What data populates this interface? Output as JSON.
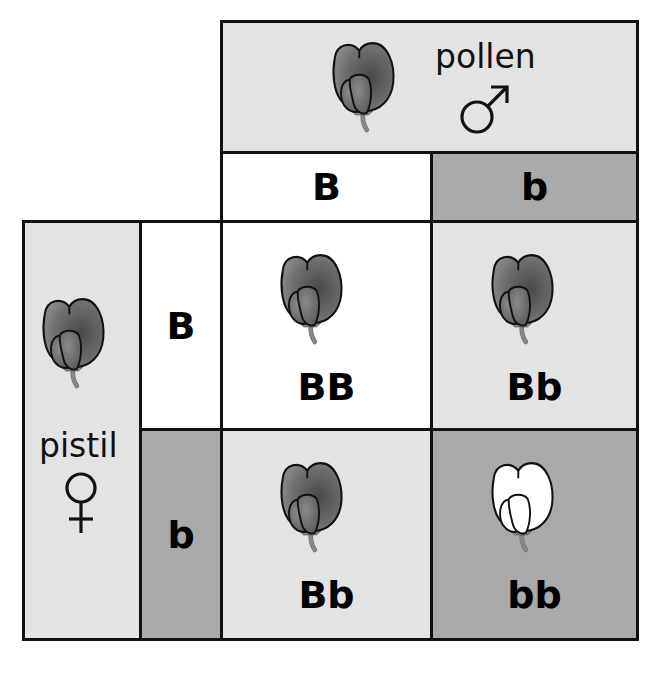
{
  "diagram": {
    "type": "punnett-square",
    "colors": {
      "border": "#111111",
      "light_fill": "#e3e3e3",
      "white_fill": "#ffffff",
      "dark_fill": "#aaaaaa",
      "purple_flower": "#6e6e6e",
      "white_flower": "#ffffff",
      "stem": "#888888"
    },
    "male": {
      "label": "pollen",
      "symbol": "♂",
      "flower": "purple-flower"
    },
    "female": {
      "label": "pistil",
      "symbol": "♀",
      "flower": "purple-flower"
    },
    "pollen_alleles": [
      "B",
      "b"
    ],
    "pistil_alleles": [
      "B",
      "b"
    ],
    "offspring": [
      {
        "genotype": "BB",
        "flower": "purple"
      },
      {
        "genotype": "Bb",
        "flower": "purple"
      },
      {
        "genotype": "Bb",
        "flower": "purple"
      },
      {
        "genotype": "bb",
        "flower": "white"
      }
    ]
  }
}
